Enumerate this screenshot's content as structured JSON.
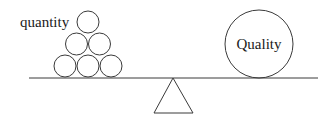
{
  "diagram": {
    "labels": {
      "left": "quantity",
      "right": "Quality"
    },
    "colors": {
      "stroke": "#3a3a3a",
      "text": "#1a1a1a",
      "background": "#ffffff"
    },
    "beam": {
      "x1": 29,
      "x2": 318,
      "y": 78
    },
    "fulcrum": {
      "apex": [
        173,
        78
      ],
      "base_left": [
        154,
        113
      ],
      "base_right": [
        193,
        113
      ]
    },
    "small_circles": {
      "radius": 11,
      "count": 6,
      "centers": [
        [
          88,
          22
        ],
        [
          76,
          44
        ],
        [
          100,
          44
        ],
        [
          65,
          66
        ],
        [
          88,
          66
        ],
        [
          111,
          66
        ]
      ]
    },
    "large_circle": {
      "cx": 259,
      "cy": 44,
      "r": 34
    }
  }
}
